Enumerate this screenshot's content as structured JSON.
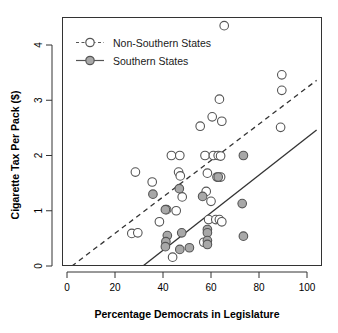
{
  "chart_data": {
    "type": "scatter",
    "title": "",
    "xlabel": "Percentage Democrats in Legislature",
    "ylabel": "Cigarette Tax Per Pack ($)",
    "xlim": [
      -4,
      104
    ],
    "ylim": [
      -0.28,
      4.45
    ],
    "xticks": [
      0,
      20,
      40,
      60,
      80,
      100
    ],
    "yticks": [
      0,
      1,
      2,
      3,
      4
    ],
    "xtick_labels": [
      "0",
      "20",
      "40",
      "60",
      "80",
      "100"
    ],
    "ytick_labels": [
      "0",
      "1",
      "2",
      "3",
      "4"
    ],
    "grid": false,
    "legend_position": "top-left",
    "legend": [
      {
        "name": "Non-Southern States",
        "marker": "open-circle",
        "fill": "#ffffff",
        "stroke": "#555555",
        "line": "dashed"
      },
      {
        "name": "Southern States",
        "marker": "filled-circle",
        "fill": "#a8a8a8",
        "stroke": "#555555",
        "line": "solid"
      }
    ],
    "series": [
      {
        "name": "Non-Southern States",
        "marker": "open-circle",
        "points": [
          [
            65.5,
            4.35
          ],
          [
            89.5,
            3.46
          ],
          [
            89.5,
            3.18
          ],
          [
            63.5,
            3.02
          ],
          [
            60.5,
            2.7
          ],
          [
            64.5,
            2.62
          ],
          [
            55.5,
            2.53
          ],
          [
            89.0,
            2.51
          ],
          [
            43.5,
            2.0
          ],
          [
            47.0,
            2.0
          ],
          [
            57.5,
            2.0
          ],
          [
            61.0,
            2.0
          ],
          [
            63.0,
            2.0
          ],
          [
            64.0,
            1.99
          ],
          [
            28.5,
            1.7
          ],
          [
            46.5,
            1.7
          ],
          [
            47.2,
            1.63
          ],
          [
            58.5,
            1.68
          ],
          [
            62.5,
            1.61
          ],
          [
            64.0,
            1.61
          ],
          [
            35.5,
            1.52
          ],
          [
            48.0,
            1.25
          ],
          [
            58.0,
            1.35
          ],
          [
            60.0,
            1.17
          ],
          [
            41.5,
            1.02
          ],
          [
            45.5,
            1.0
          ],
          [
            38.5,
            0.8
          ],
          [
            59.0,
            0.84
          ],
          [
            62.0,
            0.84
          ],
          [
            63.5,
            0.84
          ],
          [
            64.5,
            0.8
          ],
          [
            27.0,
            0.59
          ],
          [
            29.5,
            0.6
          ],
          [
            57.0,
            0.43
          ],
          [
            44.0,
            0.16
          ]
        ]
      },
      {
        "name": "Southern States",
        "marker": "filled-circle",
        "points": [
          [
            73.5,
            2.0
          ],
          [
            63.0,
            1.61
          ],
          [
            46.8,
            1.4
          ],
          [
            35.8,
            1.3
          ],
          [
            56.5,
            1.26
          ],
          [
            73.0,
            1.13
          ],
          [
            41.0,
            1.02
          ],
          [
            47.8,
            0.6
          ],
          [
            41.8,
            0.55
          ],
          [
            58.5,
            0.66
          ],
          [
            58.5,
            0.6
          ],
          [
            73.5,
            0.54
          ],
          [
            41.2,
            0.44
          ],
          [
            58.5,
            0.46
          ],
          [
            58.5,
            0.39
          ],
          [
            41.0,
            0.35
          ],
          [
            47.0,
            0.3
          ],
          [
            51.0,
            0.33
          ]
        ]
      }
    ],
    "trend_lines": [
      {
        "name": "Non-Southern States fit",
        "style": "dashed",
        "x": [
          -4,
          104
        ],
        "y": [
          -0.2,
          3.36
        ]
      },
      {
        "name": "Southern States fit",
        "style": "solid",
        "x": [
          24.0,
          104
        ],
        "y": [
          -0.26,
          2.46
        ]
      }
    ]
  }
}
